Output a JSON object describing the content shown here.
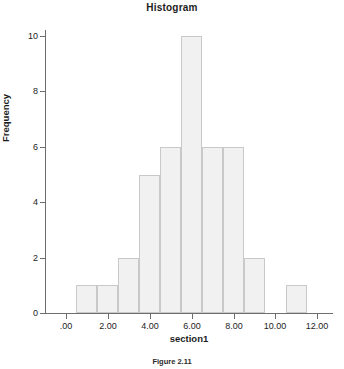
{
  "chart_data": {
    "type": "bar",
    "title": "Histogram",
    "xlabel": "section1",
    "ylabel": "Frequency",
    "categories": [
      "0.5-1.5",
      "1.5-2.5",
      "2.5-3.5",
      "3.5-4.5",
      "4.5-5.5",
      "5.5-6.5",
      "6.5-7.5",
      "7.5-8.5",
      "8.5-9.5",
      "9.5-10.5"
    ],
    "bin_starts": [
      0.5,
      1.5,
      2.5,
      3.5,
      4.5,
      5.5,
      6.5,
      7.5,
      8.5,
      10.5
    ],
    "bin_width": 1,
    "values": [
      1,
      1,
      2,
      5,
      6,
      10,
      6,
      6,
      2,
      1
    ],
    "xlim": [
      -1.0,
      12.7
    ],
    "ylim": [
      0,
      10.2
    ],
    "xticks": [
      0,
      2,
      4,
      6,
      8,
      10,
      12
    ],
    "xticklabels": [
      ".00",
      "2.00",
      "4.00",
      "6.00",
      "8.00",
      "10.00",
      "12.00"
    ],
    "yticks": [
      0,
      2,
      4,
      6,
      8,
      10
    ],
    "yticklabels": [
      "0",
      "2",
      "4",
      "6",
      "8",
      "10"
    ],
    "grid": false,
    "legend": "none",
    "bar_fill_color": "#f1f1f1",
    "bar_border_color": "#c9c9c9",
    "axis_color": "#6e6e6e"
  },
  "caption": {
    "text": "Figure 2.11"
  }
}
